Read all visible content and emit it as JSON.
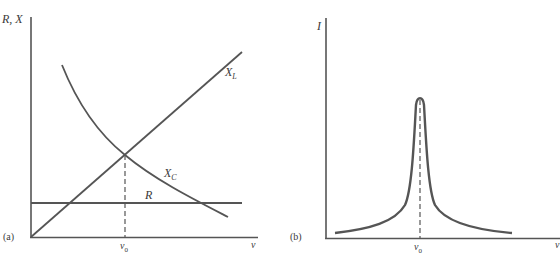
{
  "panel_a": {
    "tag": "(a)",
    "y_label": "R, X",
    "x_label": "ν",
    "x_marker": "ν",
    "x_marker_sub": "0",
    "curves": {
      "xl": {
        "label": "X",
        "sub": "L"
      },
      "xc": {
        "label": "X",
        "sub": "C"
      },
      "r": {
        "label": "R"
      }
    }
  },
  "panel_b": {
    "tag": "(b)",
    "y_label": "I",
    "x_label": "ν",
    "x_marker": "ν",
    "x_marker_sub": "0"
  },
  "colors": {
    "line": "#555555",
    "text": "#3a3a3a"
  }
}
